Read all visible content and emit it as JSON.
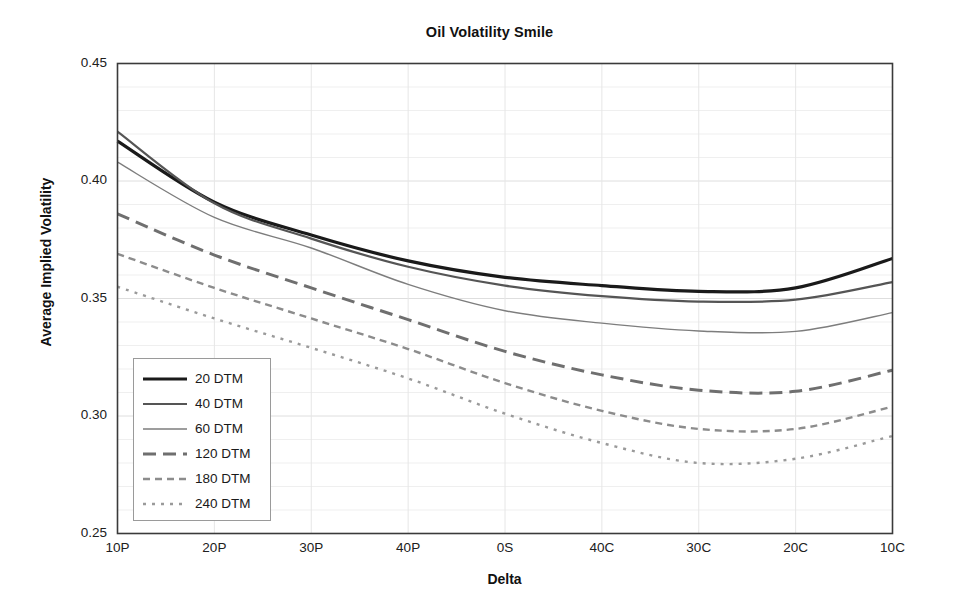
{
  "chart_data": {
    "type": "line",
    "title": "Oil Volatility Smile",
    "xlabel": "Delta",
    "ylabel": "Average Implied Volatility",
    "categories": [
      "10P",
      "20P",
      "30P",
      "40P",
      "0S",
      "40C",
      "30C",
      "20C",
      "10C"
    ],
    "ylim": [
      0.25,
      0.45
    ],
    "ytick_labels": [
      "0.45",
      "0.40",
      "0.35",
      "0.30",
      "0.25"
    ],
    "ytick_values": [
      0.45,
      0.4,
      0.35,
      0.3,
      0.25
    ],
    "grid": true,
    "legend_position": "lower-left inside plot",
    "series": [
      {
        "name": "20 DTM",
        "values": [
          0.417,
          0.391,
          0.377,
          0.366,
          0.359,
          0.3555,
          0.353,
          0.3545,
          0.367
        ],
        "color": "#1a1a1a",
        "width": 3.2,
        "dash": "none"
      },
      {
        "name": "40 DTM",
        "values": [
          0.421,
          0.3905,
          0.3755,
          0.3635,
          0.3555,
          0.351,
          0.3487,
          0.3495,
          0.357
        ],
        "color": "#555555",
        "width": 2.2,
        "dash": "none"
      },
      {
        "name": "60 DTM",
        "values": [
          0.408,
          0.3845,
          0.3715,
          0.356,
          0.3448,
          0.3395,
          0.3362,
          0.336,
          0.344
        ],
        "color": "#7d7d7d",
        "width": 1.4,
        "dash": "none"
      },
      {
        "name": "120 DTM",
        "values": [
          0.386,
          0.3685,
          0.3545,
          0.341,
          0.3275,
          0.3175,
          0.311,
          0.3105,
          0.3195
        ],
        "color": "#6f6f6f",
        "width": 3.0,
        "dash": "13,7"
      },
      {
        "name": "180 DTM",
        "values": [
          0.369,
          0.3545,
          0.3415,
          0.3285,
          0.314,
          0.3022,
          0.2945,
          0.2945,
          0.304
        ],
        "color": "#8c8c8c",
        "width": 2.4,
        "dash": "7,5"
      },
      {
        "name": "240 DTM",
        "values": [
          0.355,
          0.3415,
          0.329,
          0.316,
          0.301,
          0.2885,
          0.28,
          0.2818,
          0.2915
        ],
        "color": "#9a9a9a",
        "width": 2.4,
        "dash": "3,6"
      }
    ]
  },
  "axes": {
    "y_ticks": [
      {
        "label": "0.45"
      },
      {
        "label": "0.40"
      },
      {
        "label": "0.35"
      },
      {
        "label": "0.30"
      },
      {
        "label": "0.25"
      }
    ],
    "x_ticks": [
      {
        "label": "10P"
      },
      {
        "label": "20P"
      },
      {
        "label": "30P"
      },
      {
        "label": "40P"
      },
      {
        "label": "0S"
      },
      {
        "label": "40C"
      },
      {
        "label": "30C"
      },
      {
        "label": "20C"
      },
      {
        "label": "10C"
      }
    ]
  },
  "colors": {
    "plot_border": "#3a3a3a",
    "gridline": "#e3e3e3",
    "background": "#ffffff",
    "text": "#1a1a1a"
  }
}
